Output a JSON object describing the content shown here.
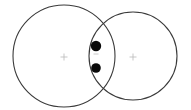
{
  "canvas": {
    "width": 191,
    "height": 110,
    "background_color": "#ffffff",
    "title": "Two overlapping circles diagram"
  },
  "style": {
    "circle_stroke_color": "#3a3a3a",
    "circle_stroke_width": 1.1,
    "circle_fill": "none",
    "dot_fill_color": "#0a0a0a",
    "center_mark_color": "#b9b9b9",
    "faint_mark_color": "#c8c8c8"
  },
  "diagram": {
    "type": "venn-two-circle",
    "shapes": [
      {
        "name": "left-circle",
        "cx": 64,
        "cy": 56,
        "r": 51,
        "label": ""
      },
      {
        "name": "right-circle",
        "cx": 133,
        "cy": 56,
        "r": 44,
        "label": ""
      }
    ],
    "center_marks": [
      {
        "name": "left-circle-center-mark",
        "glyph": "plus",
        "x": 64,
        "y": 57,
        "size": 7
      },
      {
        "name": "right-circle-center-mark",
        "glyph": "plus",
        "x": 133,
        "y": 57,
        "size": 7
      }
    ],
    "intersection_dots": [
      {
        "name": "upper-dot",
        "cx": 96,
        "cy": 46,
        "r": 5.2
      },
      {
        "name": "lower-dot",
        "cx": 96,
        "cy": 68,
        "r": 4.8
      }
    ],
    "faint_marks": [
      {
        "name": "dash-mark-between-dots",
        "glyph": "dash",
        "x": 96,
        "y": 54,
        "width": 5
      }
    ],
    "intersection": {
      "name": "lens-region",
      "top_crossing": {
        "x": 96,
        "y": 30
      },
      "bottom_crossing": {
        "x": 96,
        "y": 82
      }
    }
  }
}
